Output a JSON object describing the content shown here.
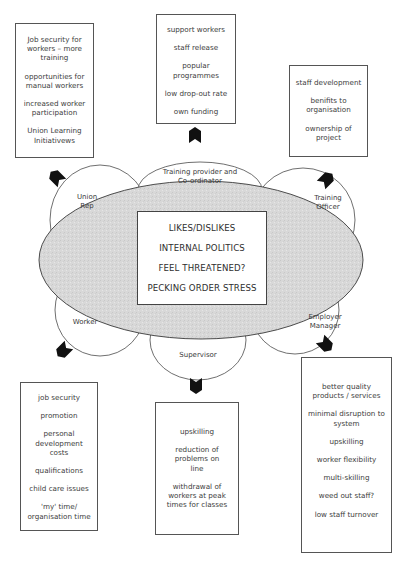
{
  "diagram": {
    "center": {
      "items": [
        "LIKES/DISLIKES",
        "INTERNAL POLITICS",
        "FEEL THREATENED?",
        "PECKING ORDER STRESS"
      ]
    },
    "stakeholders": {
      "union_rep": {
        "label_line1": "Union",
        "label_line2": "Rep",
        "benefits": [
          "Job security for workers – more training",
          "opportunities for manual workers",
          "increased worker participation",
          "Union Learning Initiativews"
        ]
      },
      "training_provider": {
        "label_line1": "Training provider and",
        "label_line2": "Co-ordinator",
        "benefits": [
          "support workers",
          "staff release",
          "popular programmes",
          "low drop-out rate",
          "own funding"
        ]
      },
      "training_officer": {
        "label_line1": "Training",
        "label_line2": "Officer",
        "benefits": [
          "staff development",
          "benifits to organisation",
          "ownership of project"
        ]
      },
      "worker": {
        "label_line1": "Worker",
        "benefits": [
          "job security",
          "promotion",
          "personal development costs",
          "qualifications",
          "child care issues",
          "'my' time/ organisation time"
        ]
      },
      "supervisor": {
        "label_line1": "Supervisor",
        "benefits": [
          "upskilling",
          "reduction of problems on line",
          "withdrawal of workers at peak times for classes"
        ]
      },
      "employer_manager": {
        "label_line1": "Employer",
        "label_line2": "Manager",
        "benefits": [
          "better quality products / services",
          "minimal disruption to system",
          "upskilling",
          "worker flexibility",
          "multi-skilling",
          "weed out staff?",
          "low staff turnover"
        ]
      }
    },
    "colors": {
      "ellipse_fill": "#d6d6d6",
      "stroke": "#4a4a4a",
      "arrow": "#111111",
      "text": "#3a3a3a"
    }
  }
}
